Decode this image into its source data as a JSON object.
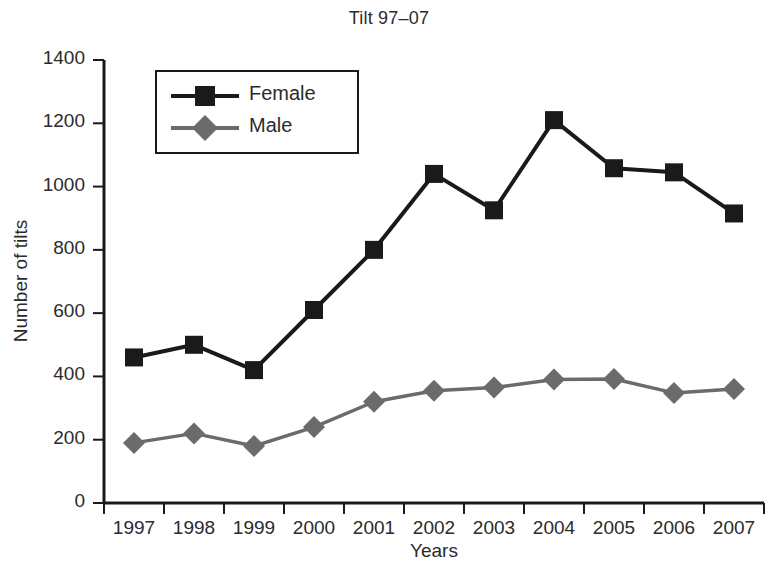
{
  "chart_data": {
    "type": "line",
    "title": "Tilt 97–07",
    "xlabel": "Years",
    "ylabel": "Number of tilts",
    "categories": [
      "1997",
      "1998",
      "1999",
      "2000",
      "2001",
      "2002",
      "2003",
      "2004",
      "2005",
      "2006",
      "2007"
    ],
    "series": [
      {
        "name": "Female",
        "color": "#1a1a1a",
        "marker": "square",
        "values": [
          460,
          500,
          420,
          610,
          800,
          1040,
          925,
          1210,
          1058,
          1045,
          915
        ]
      },
      {
        "name": "Male",
        "color": "#6b6b6b",
        "marker": "diamond",
        "values": [
          190,
          220,
          180,
          240,
          320,
          355,
          365,
          390,
          392,
          348,
          360
        ]
      }
    ],
    "ylim": [
      0,
      1400
    ],
    "yticks": [
      0,
      200,
      400,
      600,
      800,
      1000,
      1200,
      1400
    ],
    "ytick_labels": [
      "0",
      "200",
      "400",
      "600",
      "800",
      "1000",
      "1200",
      "1400"
    ],
    "grid": false,
    "legend_position": "upper left"
  }
}
